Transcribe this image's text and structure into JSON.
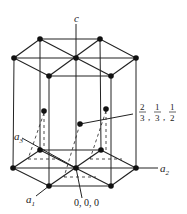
{
  "diagram": {
    "axis_labels": {
      "c": "c",
      "a1": "a",
      "a1_sub": "1",
      "a2": "a",
      "a2_sub": "2",
      "a3": "a",
      "a3_sub": "3"
    },
    "annotations": {
      "origin": "0, 0, 0",
      "interior_num": [
        "2",
        "1",
        "1"
      ],
      "interior_den": [
        "3",
        "3",
        "2"
      ],
      "interior_sep": ","
    },
    "colors": {
      "line": "#222222",
      "atom": "#111111",
      "background": "#ffffff"
    }
  }
}
